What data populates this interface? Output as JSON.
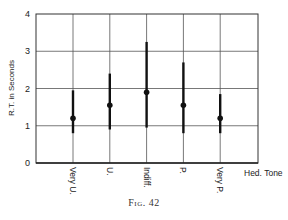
{
  "chart_data": {
    "type": "scatter",
    "subtype": "point-with-range",
    "title": "",
    "caption": "Fig. 42",
    "xlabel": "Hed. Tone",
    "ylabel": "R.T. in Seconds",
    "ylim": [
      0,
      4
    ],
    "yticks": [
      0,
      1,
      2,
      3,
      4
    ],
    "grid": true,
    "legend": null,
    "categories": [
      "Very U.",
      "U.",
      "Indiff.",
      "P.",
      "Very P."
    ],
    "series": [
      {
        "name": "mean",
        "values": [
          1.2,
          1.55,
          1.9,
          1.55,
          1.2
        ]
      },
      {
        "name": "range_high",
        "values": [
          1.95,
          2.4,
          3.25,
          2.7,
          1.85
        ]
      },
      {
        "name": "range_low",
        "values": [
          0.8,
          0.9,
          0.95,
          0.8,
          0.8
        ]
      }
    ]
  },
  "labels": {
    "caption_prefix": "Fig.",
    "caption_number": "42"
  }
}
